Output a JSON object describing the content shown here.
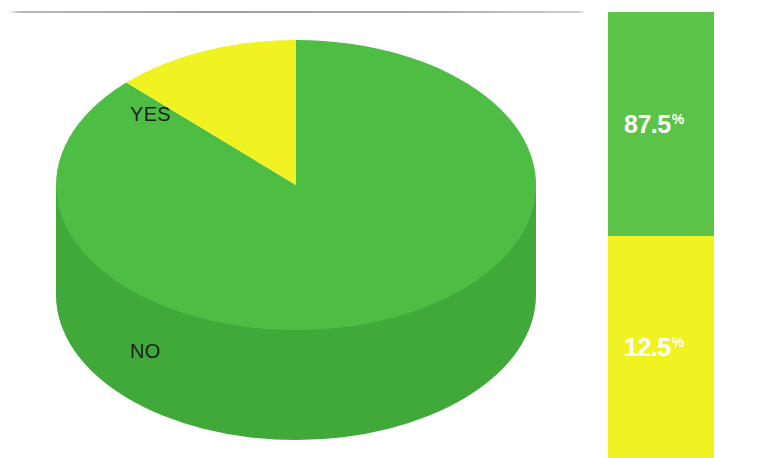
{
  "chart_data": {
    "type": "pie",
    "title": "",
    "subtitle": "",
    "xlabel": "",
    "ylabel": "",
    "legend_position": "right",
    "grid": false,
    "style": "3d-pie",
    "categories": [
      "YES",
      "NO"
    ],
    "values": [
      87.5,
      12.5
    ],
    "value_labels": [
      "87.5",
      "12.5"
    ],
    "value_suffix": "%",
    "colors": [
      "#4dbe43",
      "#f1f222"
    ],
    "slices": [
      {
        "label": "YES",
        "value": 87.5,
        "value_label": "87.5",
        "suffix": "%",
        "color": "#4dbe43",
        "side_color": "#41a93a",
        "start_angle_deg": 45,
        "sweep_deg": 315
      },
      {
        "label": "NO",
        "value": 12.5,
        "value_label": "12.5",
        "suffix": "%",
        "color": "#f1f222",
        "side_color": "#dcdd1e",
        "start_angle_deg": 0,
        "sweep_deg": 45
      }
    ]
  },
  "legend": {
    "bar_segments": [
      {
        "category": "YES",
        "value_label": "87.5",
        "suffix": "%",
        "color": "#5bc347",
        "text_color": "#ffffff"
      },
      {
        "category": "NO",
        "value_label": "12.5",
        "suffix": "%",
        "color": "#f1f222",
        "text_color": "#ffffff"
      }
    ],
    "labels": [
      {
        "text": "YES"
      },
      {
        "text": "NO"
      }
    ]
  },
  "decor": {
    "rule_color": "#9e9e9e"
  }
}
